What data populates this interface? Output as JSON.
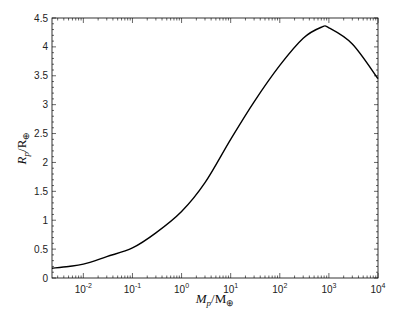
{
  "chart_data": {
    "type": "line",
    "title": "",
    "xlabel": "M_p/M_⊕",
    "ylabel": "R_p/R_⊕",
    "xscale": "log",
    "xlim": [
      0.0023,
      10000
    ],
    "ylim": [
      0,
      4.5
    ],
    "grid": false,
    "legend": null,
    "x_ticks": [
      "10^-2",
      "10^-1",
      "10^0",
      "10^1",
      "10^2",
      "10^3",
      "10^4"
    ],
    "y_ticks": [
      "0",
      "0.5",
      "1",
      "1.5",
      "2",
      "2.5",
      "3",
      "3.5",
      "4",
      "4.5"
    ],
    "series": [
      {
        "name": "mass-radius relation",
        "color": "#000000",
        "x": [
          0.0023,
          0.005,
          0.01,
          0.03,
          0.1,
          0.3,
          1,
          3,
          10,
          30,
          100,
          300,
          700,
          1000,
          3000,
          10000
        ],
        "y": [
          0.17,
          0.2,
          0.24,
          0.37,
          0.52,
          0.78,
          1.15,
          1.65,
          2.4,
          3.05,
          3.68,
          4.15,
          4.34,
          4.33,
          4.05,
          3.45
        ]
      }
    ]
  },
  "axes": {
    "x_tick_labels": [
      {
        "base": "10",
        "exp": "-2"
      },
      {
        "base": "10",
        "exp": "-1"
      },
      {
        "base": "10",
        "exp": "0"
      },
      {
        "base": "10",
        "exp": "1"
      },
      {
        "base": "10",
        "exp": "2"
      },
      {
        "base": "10",
        "exp": "3"
      },
      {
        "base": "10",
        "exp": "4"
      }
    ],
    "y_tick_labels": [
      "0",
      "0.5",
      "1",
      "1.5",
      "2",
      "2.5",
      "3",
      "3.5",
      "4",
      "4.5"
    ],
    "xlabel": {
      "main": "M",
      "sub": "p",
      "rest": "/M",
      "rest_sub": "⊕"
    },
    "ylabel": {
      "main": "R",
      "sub": "p",
      "rest": "/R",
      "rest_sub": "⊕"
    }
  }
}
